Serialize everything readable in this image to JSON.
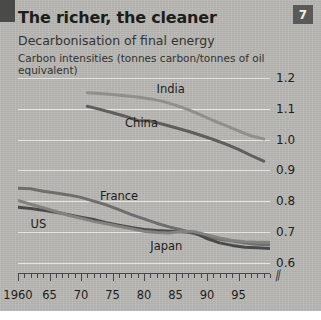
{
  "badge": {
    "number": "7"
  },
  "header": {
    "title": "The richer, the cleaner",
    "subtitle": "Decarbonisation of final energy",
    "units": "Carbon intensities (tonnes carbon/tonnes of oil equivalent)"
  },
  "colors": {
    "panel_background": "#b9b8b4",
    "gridline": "#e6e5e0",
    "axis": "#46464a",
    "text": "#1d1d1b",
    "badge_background": "#595957",
    "line_dark": "#4f4f4f",
    "line_mid": "#6e6e6e",
    "line_light": "#8f8f8c"
  },
  "chart_data": {
    "type": "line",
    "title": "The richer, the cleaner",
    "subtitle": "Decarbonisation of final energy",
    "ylabel": "Carbon intensities (tonnes carbon/tonnes of oil equivalent)",
    "xlabel": "",
    "ylim": [
      0.55,
      1.2
    ],
    "xlim": [
      1960,
      2000
    ],
    "grid": true,
    "legend": "inline-labels",
    "ytick_labels": [
      "1.2",
      "1.1",
      "1.0",
      "0.9",
      "0.8",
      "0.7",
      "0.6"
    ],
    "ytick_values": [
      1.2,
      1.1,
      1.0,
      0.9,
      0.8,
      0.7,
      0.6
    ],
    "xtick_labels": [
      "1960",
      "65",
      "70",
      "75",
      "80",
      "85",
      "90",
      "95"
    ],
    "xtick_values": [
      1960,
      1965,
      1970,
      1975,
      1980,
      1985,
      1990,
      1995
    ],
    "axis_break": true,
    "series": [
      {
        "name": "India",
        "color": "#8f8f8c",
        "label_x": 1982,
        "label_y": 1.165,
        "x": [
          1971,
          1973,
          1975,
          1977,
          1979,
          1981,
          1983,
          1985,
          1987,
          1989,
          1991,
          1993,
          1995,
          1997,
          1999
        ],
        "values": [
          1.152,
          1.15,
          1.146,
          1.142,
          1.138,
          1.132,
          1.124,
          1.112,
          1.097,
          1.08,
          1.062,
          1.045,
          1.028,
          1.012,
          1.002
        ]
      },
      {
        "name": "China",
        "color": "#5e5e5e",
        "label_x": 1977,
        "label_y": 1.055,
        "x": [
          1971,
          1973,
          1975,
          1977,
          1979,
          1981,
          1983,
          1985,
          1987,
          1989,
          1991,
          1993,
          1995,
          1997,
          1999
        ],
        "values": [
          1.108,
          1.098,
          1.087,
          1.076,
          1.062,
          1.06,
          1.05,
          1.038,
          1.027,
          1.014,
          1.0,
          0.985,
          0.968,
          0.948,
          0.93
        ]
      },
      {
        "name": "France",
        "color": "#6e6e6e",
        "label_x": 1973,
        "label_y": 0.815,
        "x": [
          1960,
          1962,
          1964,
          1966,
          1968,
          1970,
          1972,
          1974,
          1976,
          1978,
          1980,
          1982,
          1984,
          1986,
          1988,
          1990,
          1992,
          1994,
          1996,
          1998,
          2000
        ],
        "values": [
          0.842,
          0.84,
          0.832,
          0.826,
          0.82,
          0.812,
          0.8,
          0.788,
          0.772,
          0.756,
          0.742,
          0.728,
          0.716,
          0.706,
          0.694,
          0.684,
          0.676,
          0.67,
          0.664,
          0.66,
          0.658
        ]
      },
      {
        "name": "US",
        "color": "#4a4a4a",
        "label_x": 1962,
        "label_y": 0.725,
        "x": [
          1960,
          1962,
          1964,
          1966,
          1968,
          1970,
          1972,
          1974,
          1976,
          1978,
          1980,
          1982,
          1984,
          1986,
          1988,
          1990,
          1992,
          1994,
          1996,
          1998,
          2000
        ],
        "values": [
          0.78,
          0.776,
          0.77,
          0.764,
          0.756,
          0.748,
          0.74,
          0.73,
          0.722,
          0.714,
          0.708,
          0.704,
          0.702,
          0.7,
          0.698,
          0.678,
          0.664,
          0.656,
          0.65,
          0.648,
          0.646
        ]
      },
      {
        "name": "Japan",
        "color": "#82827e",
        "label_x": 1981,
        "label_y": 0.655,
        "x": [
          1960,
          1962,
          1964,
          1966,
          1968,
          1970,
          1972,
          1974,
          1976,
          1978,
          1980,
          1982,
          1984,
          1986,
          1988,
          1990,
          1992,
          1994,
          1996,
          1998,
          2000
        ],
        "values": [
          0.802,
          0.79,
          0.778,
          0.766,
          0.754,
          0.744,
          0.734,
          0.726,
          0.718,
          0.71,
          0.702,
          0.698,
          0.696,
          0.702,
          0.7,
          0.69,
          0.68,
          0.672,
          0.668,
          0.666,
          0.666
        ]
      }
    ]
  }
}
